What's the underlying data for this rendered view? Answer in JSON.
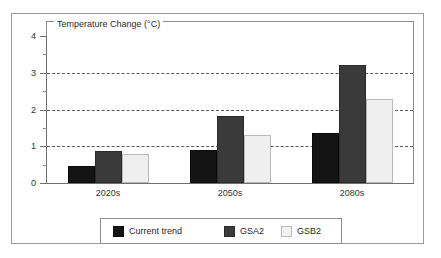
{
  "chart_data": {
    "type": "bar",
    "title": "Temperature Change (°C)",
    "xlabel": "",
    "ylabel": "",
    "categories": [
      "2020s",
      "2050s",
      "2080s"
    ],
    "series": [
      {
        "name": "Current trend",
        "color": "#141414",
        "values": [
          0.45,
          0.9,
          1.35
        ]
      },
      {
        "name": "GSA2",
        "color": "#3a3a3a",
        "values": [
          0.88,
          1.82,
          3.2
        ]
      },
      {
        "name": "GSB2",
        "color": "#efefef",
        "values": [
          0.8,
          1.3,
          2.28
        ]
      }
    ],
    "ylim": [
      0,
      4
    ],
    "y_ticks": [
      "0",
      "1",
      "2",
      "3",
      "4"
    ],
    "y_tick_values": [
      0,
      1,
      2,
      3,
      4
    ],
    "y_minor_tick_values": [
      0.5,
      1.5,
      2.5,
      3.5
    ],
    "gridlines": [
      1,
      2,
      3
    ],
    "grid": true,
    "legend_position": "bottom"
  },
  "legend": {
    "entries": [
      {
        "label": "Current trend"
      },
      {
        "label": "GSA2"
      },
      {
        "label": "GSB2"
      }
    ]
  }
}
